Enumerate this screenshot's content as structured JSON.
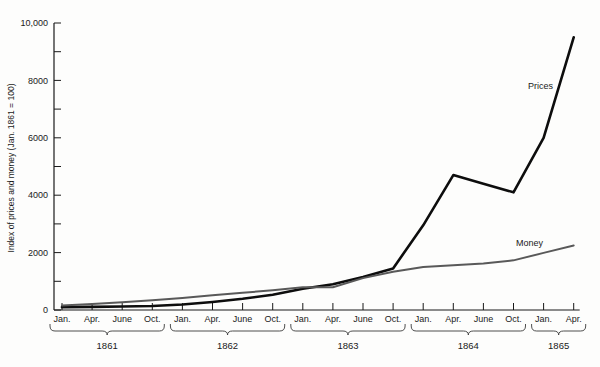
{
  "chart_data": {
    "type": "line",
    "title": "",
    "subtitle": "",
    "xlabel": "",
    "ylabel": "Index of prices and money (Jan. 1861 = 100)",
    "ylim": [
      0,
      10000
    ],
    "y_major_ticks": [
      0,
      2000,
      4000,
      6000,
      8000,
      10000
    ],
    "y_major_tick_labels": [
      "0",
      "2000",
      "4000",
      "6000",
      "8000",
      "10,000"
    ],
    "y_minor_ticks": [
      1000,
      3000,
      5000,
      7000,
      9000
    ],
    "grid": false,
    "legend_position": "inline-annotation",
    "x": [
      "Jan. 1861",
      "Apr. 1861",
      "June 1861",
      "Oct. 1861",
      "Jan. 1862",
      "Apr. 1862",
      "June 1862",
      "Oct. 1862",
      "Jan. 1863",
      "Apr. 1863",
      "June 1863",
      "Oct. 1863",
      "Jan. 1864",
      "Apr. 1864",
      "June 1864",
      "Oct. 1864",
      "Jan. 1865",
      "Apr. 1865"
    ],
    "x_tick_labels": [
      "Jan.",
      "Apr.",
      "June",
      "Oct.",
      "Jan.",
      "Apr.",
      "June",
      "Oct.",
      "Jan.",
      "Apr.",
      "June",
      "Oct.",
      "Jan.",
      "Apr.",
      "June",
      "Oct.",
      "Jan.",
      "Apr."
    ],
    "year_groups": [
      {
        "label": "1861",
        "first_tick_index": 0,
        "last_tick_index": 3
      },
      {
        "label": "1862",
        "first_tick_index": 4,
        "last_tick_index": 7
      },
      {
        "label": "1863",
        "first_tick_index": 8,
        "last_tick_index": 11
      },
      {
        "label": "1864",
        "first_tick_index": 12,
        "last_tick_index": 15
      },
      {
        "label": "1865",
        "first_tick_index": 16,
        "last_tick_index": 17
      }
    ],
    "series": [
      {
        "name": "Prices",
        "color": "#0d0d0d",
        "annotation_label": "Prices",
        "values": [
          100,
          110,
          120,
          140,
          190,
          280,
          390,
          530,
          740,
          900,
          1150,
          1450,
          2950,
          4700,
          4400,
          4100,
          6000,
          9500
        ]
      },
      {
        "name": "Money",
        "color": "#595959",
        "annotation_label": "Money",
        "values": [
          160,
          210,
          270,
          340,
          420,
          510,
          600,
          690,
          790,
          790,
          1110,
          1330,
          1500,
          1560,
          1620,
          1730,
          1990,
          2250
        ]
      }
    ]
  }
}
